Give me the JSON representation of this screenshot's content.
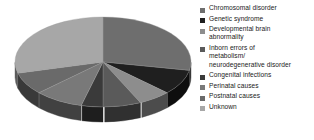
{
  "chart_data": {
    "type": "pie",
    "title": "",
    "subtitle": "",
    "xlabel": "",
    "ylabel": "",
    "three_d": true,
    "legend_position": "right",
    "grid": false,
    "start_angle_deg": -90,
    "direction": "clockwise",
    "categories": [
      "Chromosomal disorder",
      "Genetic syndrome",
      "Developmental brain abnormality",
      "Inborn errors of metabolism/ neurodegenerative disorder",
      "Congenital infections",
      "Perinatal causes",
      "Postnatal causes",
      "Unknown"
    ],
    "values": [
      28,
      9,
      6,
      7,
      4,
      9,
      8,
      29
    ],
    "colors": [
      "#6e6e6e",
      "#1f1f1f",
      "#8d8d8d",
      "#5a5a5a",
      "#3a3a3a",
      "#797979",
      "#6a6a6a",
      "#a7a7a7"
    ],
    "side_colors": [
      "#3a3a3a",
      "#0e0e0e",
      "#4c4c4c",
      "#303030",
      "#1e1e1e",
      "#414141",
      "#393939",
      "#5c5c5c"
    ]
  },
  "legend": {
    "items": [
      {
        "label": "Chromosomal disorder",
        "color": "#6e6e6e",
        "marker": "square-marker"
      },
      {
        "label": "Genetic syndrome",
        "color": "#1f1f1f",
        "marker": "square-marker"
      },
      {
        "label": "Developmental brain\nabnormality",
        "color": "#8d8d8d",
        "marker": "square-marker"
      },
      {
        "label": "Inborn errors of\nmetabolism/\nneurodegenerative disorder",
        "color": "#5a5a5a",
        "marker": "square-marker"
      },
      {
        "label": "Congenital infections",
        "color": "#3a3a3a",
        "marker": "square-marker"
      },
      {
        "label": "Perinatal causes",
        "color": "#797979",
        "marker": "square-marker"
      },
      {
        "label": "Postnatal causes",
        "color": "#6a6a6a",
        "marker": "square-marker"
      },
      {
        "label": "Unknown",
        "color": "#a7a7a7",
        "marker": "square-marker"
      }
    ]
  },
  "figure": {
    "background": "#ffffff",
    "pie_center_x": 103,
    "pie_center_y": 62,
    "pie_radius_x": 88,
    "pie_radius_y": 45,
    "pie_depth": 15
  }
}
